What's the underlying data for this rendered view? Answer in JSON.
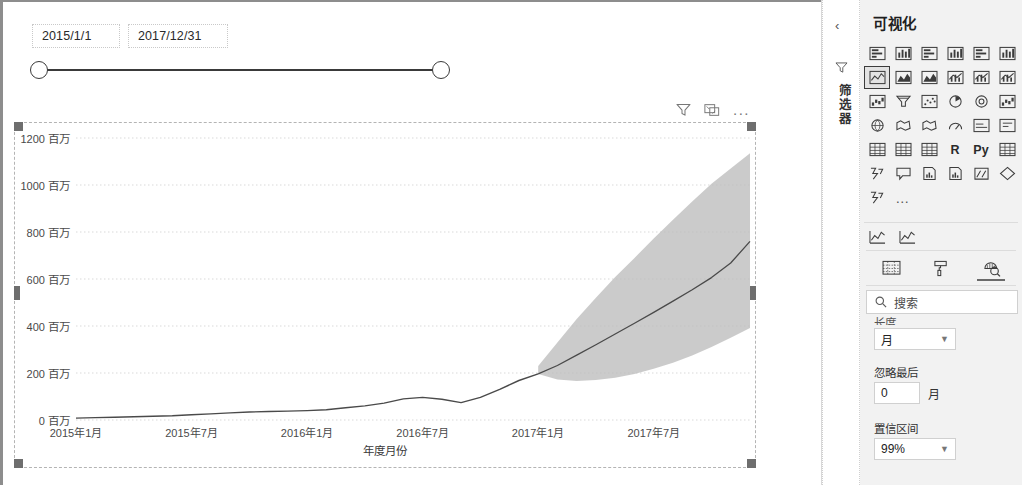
{
  "slicer": {
    "start_value": "2015/1/1",
    "end_value": "2017/12/31"
  },
  "chart_visual": {
    "header_icons": {
      "filter": "filter-icon",
      "focus": "focus-mode-icon",
      "more": "..."
    }
  },
  "chart_data": {
    "type": "line",
    "title": "",
    "xlabel": "年度月份",
    "ylabel": "",
    "unit_suffix": "百万",
    "ylim": [
      0,
      1200
    ],
    "ytick_values": [
      0,
      200,
      400,
      600,
      800,
      1000,
      1200
    ],
    "ytick_labels": [
      "0 百万",
      "200 百万",
      "400 百万",
      "600 百万",
      "800 百万",
      "1000 百万",
      "1200 百万"
    ],
    "xtick_labels": [
      "2015年1月",
      "2015年7月",
      "2016年1月",
      "2016年7月",
      "2017年1月",
      "2017年7月"
    ],
    "xtick_positions": [
      0,
      6,
      12,
      18,
      24,
      30
    ],
    "x_index_range": [
      0,
      35
    ],
    "grid": true,
    "legend": "none",
    "series": [
      {
        "name": "实际值",
        "kind": "line",
        "color": "#4a4a4a",
        "x": [
          0,
          1,
          2,
          3,
          4,
          5,
          6,
          7,
          8,
          9,
          10,
          11,
          12,
          13,
          14,
          15,
          16,
          17,
          18,
          19,
          20,
          21,
          22,
          23,
          24
        ],
        "values": [
          8,
          10,
          12,
          14,
          16,
          18,
          22,
          26,
          30,
          34,
          36,
          38,
          40,
          44,
          52,
          60,
          72,
          90,
          96,
          88,
          74,
          96,
          130,
          168,
          196
        ]
      },
      {
        "name": "预测",
        "kind": "forecast-line",
        "color": "#4a4a4a",
        "x": [
          24,
          25,
          26,
          27,
          28,
          29,
          30,
          31,
          32,
          33,
          34,
          35
        ],
        "values": [
          196,
          232,
          276,
          320,
          366,
          412,
          458,
          506,
          554,
          606,
          668,
          760
        ]
      },
      {
        "name": "置信区间上限",
        "kind": "band-upper",
        "color": "#bdbdbd",
        "x": [
          24,
          25,
          26,
          27,
          28,
          29,
          30,
          31,
          32,
          33,
          34,
          35
        ],
        "values": [
          230,
          330,
          430,
          520,
          608,
          690,
          772,
          852,
          930,
          1005,
          1070,
          1135
        ]
      },
      {
        "name": "置信区间下限",
        "kind": "band-lower",
        "color": "#bdbdbd",
        "x": [
          24,
          25,
          26,
          27,
          28,
          29,
          30,
          31,
          32,
          33,
          34,
          35
        ],
        "values": [
          196,
          172,
          166,
          170,
          180,
          196,
          218,
          244,
          274,
          310,
          350,
          392
        ]
      }
    ]
  },
  "filters_pane": {
    "collapse_label": "‹",
    "filter_icon": "filter-icon",
    "title": "筛选器"
  },
  "viz_pane": {
    "title": "可视化",
    "icons": [
      "stacked-bar-chart-icon",
      "stacked-column-chart-icon",
      "clustered-bar-chart-icon",
      "clustered-column-chart-icon",
      "100-stacked-bar-chart-icon",
      "100-stacked-column-chart-icon",
      "line-chart-icon",
      "area-chart-icon",
      "stacked-area-chart-icon",
      "line-stacked-column-chart-icon",
      "line-clustered-column-chart-icon",
      "ribbon-chart-icon",
      "waterfall-chart-icon",
      "funnel-chart-icon",
      "scatter-chart-icon",
      "pie-chart-icon",
      "donut-chart-icon",
      "treemap-icon",
      "map-icon",
      "filled-map-icon",
      "arcgis-map-icon",
      "gauge-icon",
      "kpi-icon",
      "card-icon",
      "multi-row-card-icon",
      "table-icon",
      "matrix-icon",
      "r-script-visual-icon",
      "python-visual-icon",
      "key-influencers-icon",
      "decomposition-tree-icon",
      "q-and-a-icon",
      "paginated-report-icon",
      "smart-narrative-icon",
      "power-apps-icon",
      "get-more-visuals-icon",
      "arrow-visual-icon",
      "more-options-icon"
    ],
    "r_label": "R",
    "py_label": "Py",
    "more_dots": "…",
    "custom_visuals": [
      "custom-line-visual-icon",
      "custom-forecast-visual-icon"
    ],
    "tabs": [
      {
        "name": "fields-tab",
        "icon": "fields-table-icon",
        "active": false
      },
      {
        "name": "format-tab",
        "icon": "paint-roller-icon",
        "active": false
      },
      {
        "name": "analytics-tab",
        "icon": "analytics-magnifier-icon",
        "active": true
      }
    ]
  },
  "analytics": {
    "search_placeholder": "搜索",
    "clipped_label": "长度",
    "unit_dropdown_value": "月",
    "ignore_last_label": "忽略最后",
    "ignore_last_value": "0",
    "ignore_last_unit": "月",
    "confidence_label": "置信区间",
    "confidence_value": "99%"
  },
  "colors": {
    "line": "#4a4a4a",
    "band": "#bdbdbd",
    "grid": "#d9d9d9",
    "pane_bg": "#f2f2f2",
    "handle": "#6e6e6e"
  }
}
